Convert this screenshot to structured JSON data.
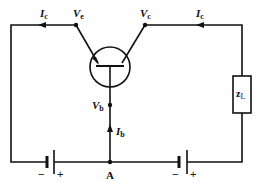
{
  "diagram": {
    "type": "common-base transistor circuit",
    "labels": {
      "ic_left": {
        "main": "I",
        "sub": "c"
      },
      "ve": {
        "main": "V",
        "sub": "e"
      },
      "vc": {
        "main": "V",
        "sub": "c"
      },
      "ic_right": {
        "main": "I",
        "sub": "c"
      },
      "vb": {
        "main": "V",
        "sub": "b"
      },
      "ib": {
        "main": "I",
        "sub": "b"
      },
      "node_a": "A",
      "load": {
        "main": "z",
        "sub": "L"
      },
      "battery_left": {
        "minus": "−",
        "plus": "+"
      },
      "battery_right": {
        "minus": "−",
        "plus": "+"
      }
    },
    "colors": {
      "line": "#111111",
      "background": "#ffffff"
    }
  }
}
